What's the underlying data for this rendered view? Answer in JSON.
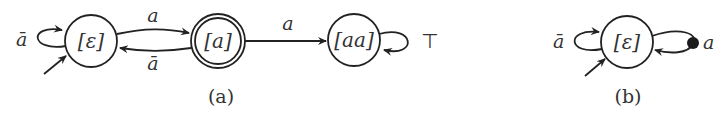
{
  "diagram": {
    "a": {
      "caption": "(a)",
      "states": [
        {
          "id": "s0",
          "label": "[ε]",
          "initial": true,
          "accepting": false
        },
        {
          "id": "s1",
          "label": "[a]",
          "initial": false,
          "accepting": true
        },
        {
          "id": "s2",
          "label": "[aa]",
          "initial": false,
          "accepting": false
        }
      ],
      "transitions": [
        {
          "from": "s0",
          "to": "s0",
          "label": "ā"
        },
        {
          "from": "s0",
          "to": "s1",
          "label": "a"
        },
        {
          "from": "s1",
          "to": "s0",
          "label": "ā"
        },
        {
          "from": "s1",
          "to": "s2",
          "label": "a"
        },
        {
          "from": "s2",
          "to": "s2",
          "label": "⊤"
        }
      ]
    },
    "b": {
      "caption": "(b)",
      "states": [
        {
          "id": "t0",
          "label": "[ε]",
          "initial": true,
          "accepting": false
        }
      ],
      "transitions": [
        {
          "from": "t0",
          "to": "t0",
          "label": "ā"
        },
        {
          "from": "t0",
          "to": "t0",
          "label": "a",
          "marker": "filled-dot"
        }
      ]
    }
  }
}
